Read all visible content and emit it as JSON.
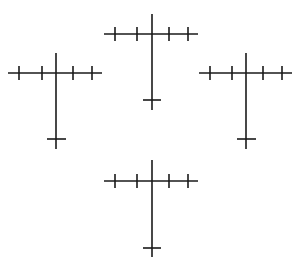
{
  "diagram": {
    "stroke_color": "#1a1a1a",
    "background": "#ffffff",
    "figures": [
      {
        "id": "top",
        "shaft_x": 152,
        "shaft_top": 14,
        "shaft_bottom": 110,
        "bar_y": 34,
        "bar_left": 104,
        "bar_right": 198,
        "ticks_x": [
          115,
          137,
          169,
          188
        ],
        "tick_half": 7,
        "guard_y": 100,
        "guard_left": 143,
        "guard_right": 161
      },
      {
        "id": "left",
        "shaft_x": 56,
        "shaft_top": 53,
        "shaft_bottom": 149,
        "bar_y": 73,
        "bar_left": 8,
        "bar_right": 102,
        "ticks_x": [
          19,
          42,
          73,
          92
        ],
        "tick_half": 7,
        "guard_y": 139,
        "guard_left": 47,
        "guard_right": 66
      },
      {
        "id": "right",
        "shaft_x": 246,
        "shaft_top": 53,
        "shaft_bottom": 149,
        "bar_y": 73,
        "bar_left": 199,
        "bar_right": 292,
        "ticks_x": [
          210,
          232,
          263,
          282
        ],
        "tick_half": 7,
        "guard_y": 139,
        "guard_left": 237,
        "guard_right": 256
      },
      {
        "id": "bottom",
        "shaft_x": 152,
        "shaft_top": 160,
        "shaft_bottom": 257,
        "bar_y": 181,
        "bar_left": 104,
        "bar_right": 198,
        "ticks_x": [
          115,
          137,
          169,
          188
        ],
        "tick_half": 7,
        "guard_y": 248,
        "guard_left": 143,
        "guard_right": 161
      }
    ]
  }
}
